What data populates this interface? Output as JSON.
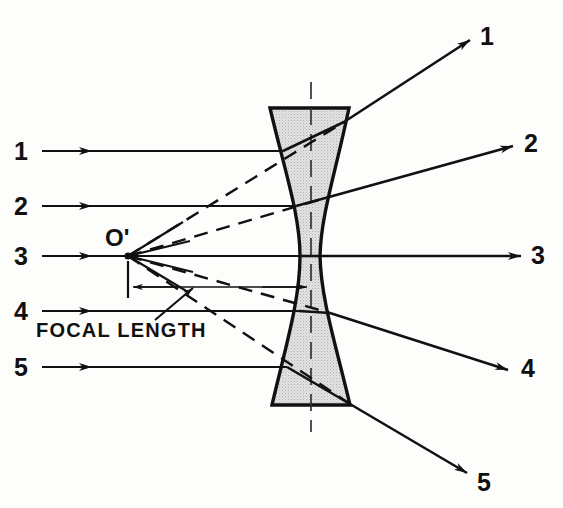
{
  "diagram": {
    "focal_point_label": "O'",
    "focal_length_label": "FOCAL LENGTH",
    "colors": {
      "stroke": "#111111",
      "lens_fill": "#d9d9d9",
      "background": "#fdfdfb"
    },
    "lens": {
      "axis_x": 311,
      "top_y": 108,
      "bottom_y": 405,
      "top_left_x": 270,
      "top_right_x": 349,
      "bottom_left_x": 272,
      "bottom_right_x": 350,
      "waist_left_x": 300,
      "waist_right_x": 320
    },
    "focal_point": {
      "x": 128,
      "y": 256
    },
    "focal_dimension": {
      "y": 287,
      "from_x": 128,
      "to_x": 311
    },
    "incoming_labels": [
      {
        "text": "1",
        "x": 22,
        "y": 160
      },
      {
        "text": "2",
        "x": 22,
        "y": 215
      },
      {
        "text": "3",
        "x": 22,
        "y": 265
      },
      {
        "text": "4",
        "x": 22,
        "y": 320
      },
      {
        "text": "5",
        "x": 22,
        "y": 376
      }
    ],
    "outgoing_labels": [
      {
        "text": "1",
        "x": 487,
        "y": 45
      },
      {
        "text": "2",
        "x": 531,
        "y": 152
      },
      {
        "text": "3",
        "x": 538,
        "y": 264
      },
      {
        "text": "4",
        "x": 528,
        "y": 377
      },
      {
        "text": "5",
        "x": 484,
        "y": 491
      }
    ],
    "rays": [
      {
        "id": "1",
        "incident_y": 151,
        "enter_x": 283,
        "exit_x": 344,
        "exit_y": 122,
        "end_x": 470,
        "end_y": 40
      },
      {
        "id": "2",
        "incident_y": 206,
        "enter_x": 296,
        "exit_x": 329,
        "exit_y": 197,
        "end_x": 513,
        "end_y": 146
      },
      {
        "id": "3",
        "incident_y": 256,
        "enter_x": 301,
        "exit_x": 320,
        "exit_y": 256,
        "end_x": 521,
        "end_y": 256
      },
      {
        "id": "4",
        "incident_y": 311,
        "enter_x": 299,
        "exit_x": 330,
        "exit_y": 313,
        "end_x": 508,
        "end_y": 370
      },
      {
        "id": "5",
        "incident_y": 367,
        "enter_x": 287,
        "exit_x": 350,
        "exit_y": 404,
        "end_x": 467,
        "end_y": 473
      }
    ]
  }
}
